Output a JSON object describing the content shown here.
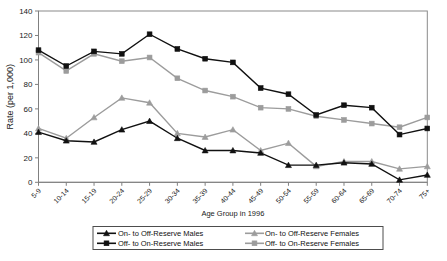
{
  "chart_data": {
    "type": "line",
    "title": "",
    "xlabel": "Age Group in 1996",
    "ylabel": "Rate (per 1,000)",
    "ylim": [
      0,
      140
    ],
    "ytick_step": 20,
    "yticks": [
      0,
      20,
      40,
      60,
      80,
      100,
      120,
      140
    ],
    "grid": false,
    "legend_position": "bottom",
    "categories": [
      "5-9",
      "10-14",
      "15-19",
      "20-24",
      "25-29",
      "30-34",
      "35-39",
      "40-44",
      "45-49",
      "50-54",
      "55-59",
      "60-64",
      "65-69",
      "70-74",
      "75+"
    ],
    "series": [
      {
        "name": "On- to Off-Reserve Males",
        "color": "#111111",
        "marker": "triangle",
        "values": [
          41,
          34,
          33,
          43,
          50,
          36,
          26,
          26,
          24,
          14,
          14,
          16,
          15,
          2,
          6
        ]
      },
      {
        "name": "Off- to On-Reserve Males",
        "color": "#111111",
        "marker": "square",
        "values": [
          108,
          95,
          107,
          105,
          121,
          109,
          101,
          98,
          77,
          72,
          55,
          63,
          61,
          39,
          44
        ]
      },
      {
        "name": "On- to Off-Reserve Females",
        "color": "#9c9c9c",
        "marker": "triangle",
        "values": [
          44,
          36,
          53,
          69,
          65,
          40,
          37,
          43,
          26,
          32,
          13,
          17,
          17,
          11,
          13
        ]
      },
      {
        "name": "Off- to On-Reserve Females",
        "color": "#9c9c9c",
        "marker": "square",
        "values": [
          106,
          91,
          105,
          99,
          102,
          85,
          75,
          70,
          61,
          60,
          54,
          51,
          48,
          45,
          53
        ]
      }
    ],
    "legend_order": [
      0,
      2,
      1,
      3
    ]
  },
  "colors": {
    "male": "#111111",
    "female": "#9c9c9c",
    "axis": "#808080",
    "plot_border": "#8a8a8a",
    "background": "#ffffff"
  }
}
